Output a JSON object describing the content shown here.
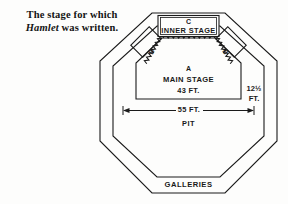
{
  "caption": {
    "line1_pre": "The stage for which",
    "title": "Hamlet",
    "line2_post": " was written."
  },
  "diagram": {
    "inner_stage": {
      "letter": "C",
      "label": "INNER STAGE"
    },
    "main_stage": {
      "letter": "A",
      "label": "MAIN STAGE",
      "dimension": "43 FT."
    },
    "side_boxes": [
      {
        "letter": "B",
        "side": "left"
      },
      {
        "letter": "B",
        "side": "right"
      }
    ],
    "pit": {
      "label": "PIT",
      "width_dimension": "55 FT."
    },
    "depth_dimension": {
      "value": "12½",
      "unit": "FT."
    },
    "galleries": {
      "label": "GALLERIES"
    },
    "colors": {
      "line": "#1a1a1a",
      "background": "#fdfdfc",
      "text": "#141414"
    }
  }
}
